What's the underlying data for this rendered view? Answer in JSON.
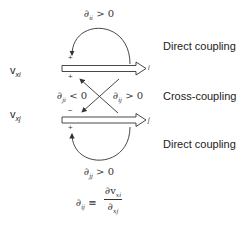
{
  "diagram": {
    "rows": [
      {
        "variable": "v",
        "variable_sub": "xi",
        "node": "i"
      },
      {
        "variable": "v",
        "variable_sub": "xj",
        "node": "j"
      }
    ],
    "loops": {
      "top": {
        "symbol": "∂",
        "sub": "ii",
        "relation": "> 0",
        "sign": "+"
      },
      "bottom": {
        "symbol": "∂",
        "sub": "jj",
        "relation": "> 0",
        "sign": "+"
      }
    },
    "cross": {
      "left": {
        "symbol": "∂",
        "sub": "ji",
        "relation": "< 0",
        "sign_top": "+",
        "sign_bottom": "−"
      },
      "right": {
        "symbol": "∂",
        "sub": "ij",
        "relation": "> 0"
      }
    },
    "labels": {
      "top": "Direct coupling",
      "middle": "Cross-coupling",
      "bottom": "Direct coupling"
    },
    "definition": {
      "lhs_symbol": "∂",
      "lhs_sub": "ij",
      "equiv": "≡",
      "num_symbol": "∂v",
      "num_sub": "xi",
      "den_symbol": "∂",
      "den_sub": "xj"
    },
    "colors": {
      "line": "#333333",
      "text": "#222222"
    }
  }
}
